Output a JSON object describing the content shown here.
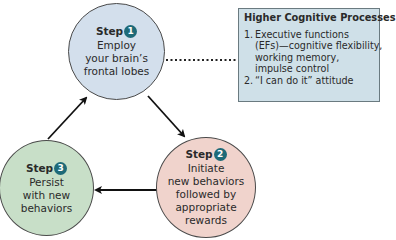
{
  "diagram": {
    "steps": [
      {
        "label": "Step",
        "number": "1",
        "lines": [
          "Employ",
          "your brain’s",
          "frontal lobes"
        ],
        "color": "#d3dfec"
      },
      {
        "label": "Step",
        "number": "2",
        "lines": [
          "Initiate",
          "new behaviors",
          "followed by",
          "appropriate",
          "rewards"
        ],
        "color": "#f0d3cc"
      },
      {
        "label": "Step",
        "number": "3",
        "lines": [
          "Persist",
          "with new",
          "behaviors"
        ],
        "color": "#c8dfc8"
      }
    ],
    "box": {
      "title": "Higher Cognitive Processes",
      "items": [
        {
          "num": "1.",
          "lines": [
            "Executive functions",
            "(EFs)—cognitive flexibility,",
            "working memory,",
            "impulse control"
          ]
        },
        {
          "num": "2.",
          "lines": [
            "“I can do it” attitude"
          ]
        }
      ],
      "color": "#cfe0e8"
    },
    "connections": [
      {
        "from": "step-1",
        "to": "step-2",
        "type": "arrow"
      },
      {
        "from": "step-2",
        "to": "step-3",
        "type": "arrow"
      },
      {
        "from": "step-3",
        "to": "step-1",
        "type": "arrow"
      },
      {
        "from": "step-1",
        "to": "box",
        "type": "dotted-line"
      }
    ],
    "badge_color": "#1e6a78"
  }
}
